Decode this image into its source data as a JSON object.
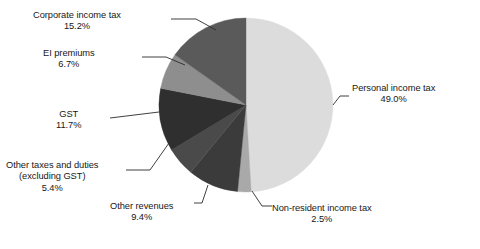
{
  "chart_data": {
    "type": "pie",
    "title": "",
    "subtitle": "",
    "xlabel": "",
    "ylabel": "",
    "legend_position": "none",
    "labels_outside": true,
    "units": "percent",
    "categories": [
      "Personal income tax",
      "Non-resident income tax",
      "Other revenues",
      "Other taxes and duties (excluding GST)",
      "GST",
      "EI premiums",
      "Corporate income tax"
    ],
    "values": [
      49.0,
      2.5,
      9.4,
      5.4,
      11.7,
      6.7,
      15.2
    ],
    "start_angle_deg": 0,
    "direction": "clockwise",
    "slices": [
      {
        "id": "personal",
        "label": "Personal income tax",
        "value": 49.0,
        "value_text": "49.0%",
        "color": "#dcdcdc",
        "label_side": "right"
      },
      {
        "id": "nonresident",
        "label": "Non-resident income tax",
        "value": 2.5,
        "value_text": "2.5%",
        "color": "#a9a9a9",
        "label_side": "bottom-right"
      },
      {
        "id": "otherrevenues",
        "label": "Other revenues",
        "value": 9.4,
        "value_text": "9.4%",
        "color": "#3b3b3b",
        "label_side": "bottom"
      },
      {
        "id": "othertaxes",
        "label": "Other taxes and duties",
        "label_line2": "(excluding GST)",
        "value": 5.4,
        "value_text": "5.4%",
        "color": "#4a4a4a",
        "label_side": "left"
      },
      {
        "id": "gst",
        "label": "GST",
        "value": 11.7,
        "value_text": "11.7%",
        "color": "#2f2f2f",
        "label_side": "left"
      },
      {
        "id": "ei",
        "label": "EI premiums",
        "value": 6.7,
        "value_text": "6.7%",
        "color": "#8e8e8e",
        "label_side": "left"
      },
      {
        "id": "corporate",
        "label": "Corporate income tax",
        "value": 15.2,
        "value_text": "15.2%",
        "color": "#5a5a5a",
        "label_side": "top-left"
      }
    ]
  },
  "labels": {
    "corporate": {
      "name": "Corporate income tax",
      "pct": "15.2%"
    },
    "ei": {
      "name": "EI premiums",
      "pct": "6.7%"
    },
    "gst": {
      "name": "GST",
      "pct": "11.7%"
    },
    "othertaxes": {
      "name": "Other taxes and duties",
      "name2": "(excluding GST)",
      "pct": "5.4%"
    },
    "otherrevenues": {
      "name": "Other revenues",
      "pct": "9.4%"
    },
    "nonresident": {
      "name": "Non-resident income tax",
      "pct": "2.5%"
    },
    "personal": {
      "name": "Personal income tax",
      "pct": "49.0%"
    }
  },
  "colors": {
    "background": "#ffffff",
    "text": "#171717",
    "leader_line": "#2b2b2b",
    "personal": "#dcdcdc",
    "nonresident": "#a9a9a9",
    "otherrevenues": "#3b3b3b",
    "othertaxes": "#4a4a4a",
    "gst": "#2f2f2f",
    "ei": "#8e8e8e",
    "corporate": "#5a5a5a"
  }
}
